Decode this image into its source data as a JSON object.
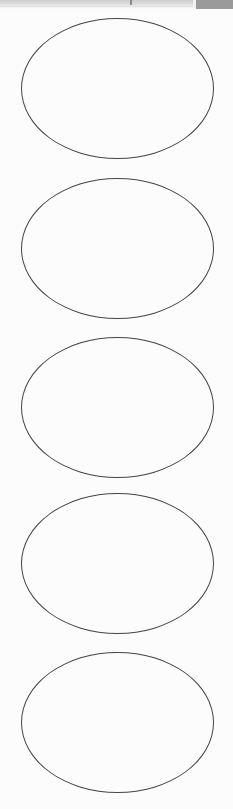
{
  "document": {
    "kind": "blank-oval-label-sheet",
    "page_background": "#fcfcfc",
    "outline_color": "#454545",
    "outline_width_px": 1,
    "label_count": 5,
    "label_shape": "ellipse",
    "label_width_px": 193,
    "label_height_px": 141,
    "label_vertical_pitch_px": 159
  },
  "toolbar": {
    "visible_height_px": 10,
    "band_color": "#cdcdcd",
    "panel_color": "#9a9a9a",
    "note": "only the bottom sliver of the application toolbar is visible; no legible labels"
  },
  "labels": [
    {
      "index": 1,
      "text": ""
    },
    {
      "index": 2,
      "text": ""
    },
    {
      "index": 3,
      "text": ""
    },
    {
      "index": 4,
      "text": ""
    },
    {
      "index": 5,
      "text": ""
    }
  ]
}
